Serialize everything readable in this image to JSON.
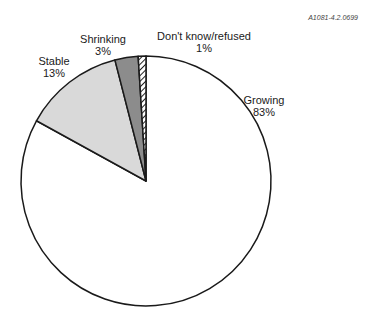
{
  "figure_id": "A1081-4.2.0699",
  "chart_data": {
    "type": "pie",
    "title": "",
    "categories": [
      "Growing",
      "Stable",
      "Shrinking",
      "Don't know/refused"
    ],
    "values": [
      83,
      13,
      3,
      1
    ],
    "unit": "%",
    "start_angle_deg": 0,
    "direction": "clockwise",
    "slices": [
      {
        "label": "Growing",
        "value": 83,
        "value_label": "83%",
        "fill": "#ffffff",
        "pattern": "none"
      },
      {
        "label": "Stable",
        "value": 13,
        "value_label": "13%",
        "fill": "#d9d9d9",
        "pattern": "none"
      },
      {
        "label": "Shrinking",
        "value": 3,
        "value_label": "3%",
        "fill": "#8c8c8c",
        "pattern": "none"
      },
      {
        "label": "Don't know/refused",
        "value": 1,
        "value_label": "1%",
        "fill": "#ffffff",
        "pattern": "diagonal-hatch"
      }
    ],
    "legend": "none (direct labels)"
  },
  "labels": {
    "growing": {
      "name": "Growing",
      "pct": "83%"
    },
    "stable": {
      "name": "Stable",
      "pct": "13%"
    },
    "shrinking": {
      "name": "Shrinking",
      "pct": "3%"
    },
    "dont_know": {
      "name": "Don't know/refused",
      "pct": "1%"
    }
  }
}
